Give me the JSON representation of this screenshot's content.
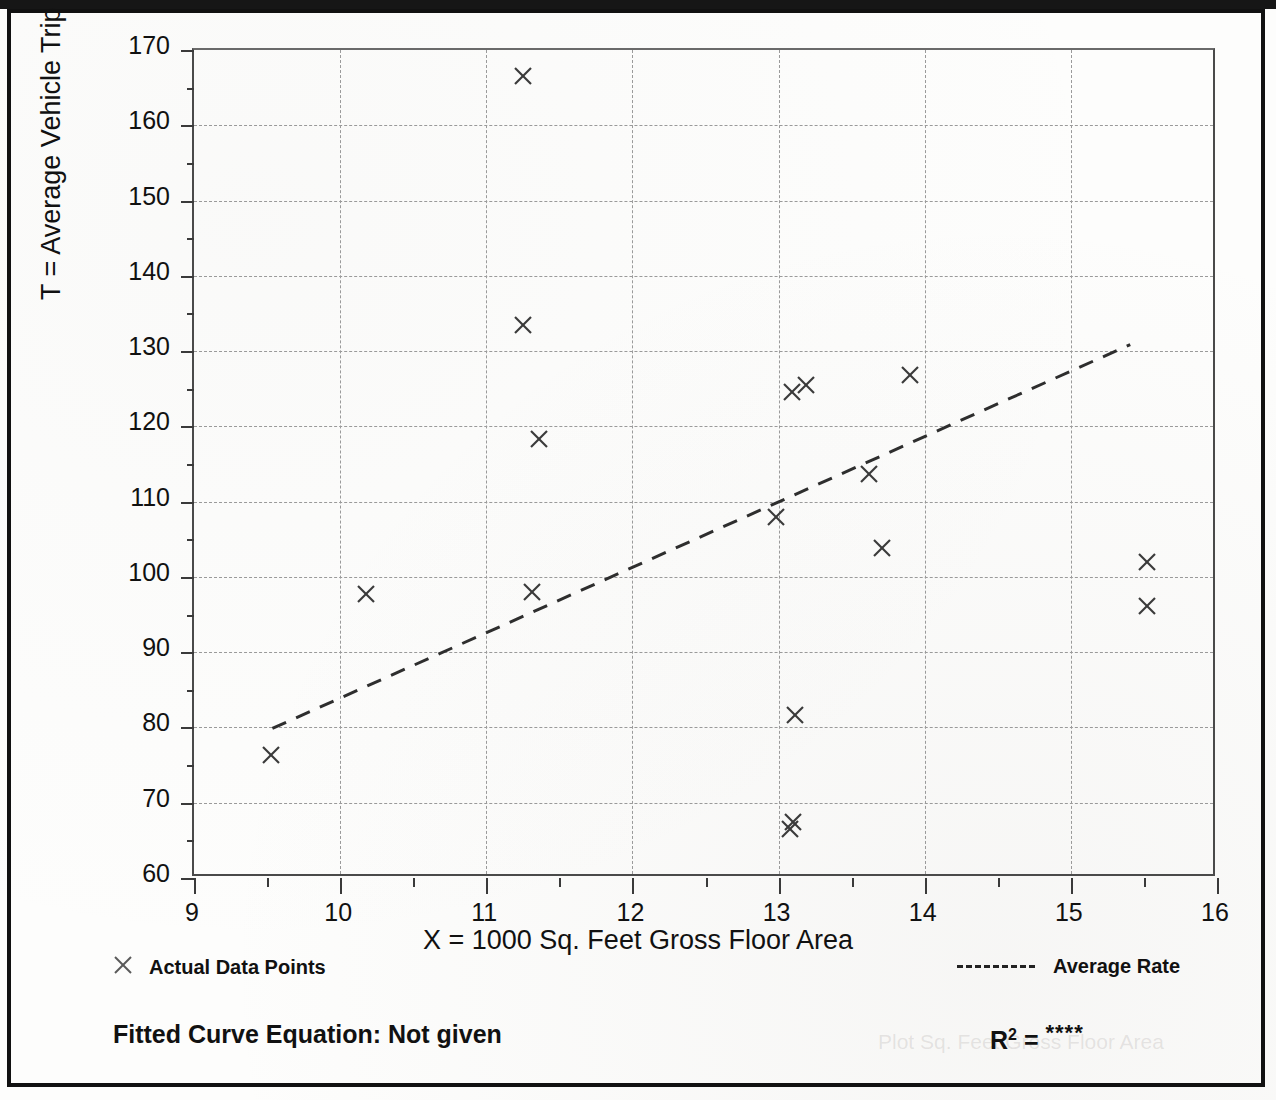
{
  "figure": {
    "y_axis_title": "T = Average Vehicle Trip Ends",
    "x_axis_title": "X = 1000 Sq. Feet Gross Floor Area",
    "legend_points_label": "Actual Data Points",
    "legend_rate_label": "Average Rate",
    "fitted_equation_label": "Fitted Curve Equation:  Not given",
    "r_squared_symbol": "R",
    "r_squared_exponent": "2",
    "r_squared_equals": " = ",
    "r_squared_value": "****",
    "ghost_text_right": "Plot Sq. Feet Gross Floor Area"
  },
  "chart_data": {
    "type": "scatter",
    "title": "",
    "xlabel": "X = 1000 Sq. Feet Gross Floor Area",
    "ylabel": "T = Average Vehicle Trip Ends",
    "xlim": [
      9,
      16
    ],
    "ylim": [
      60,
      170
    ],
    "xticks": [
      9,
      10,
      11,
      12,
      13,
      14,
      15,
      16
    ],
    "xtick_labels": [
      "9",
      "10",
      "11",
      "12",
      "13",
      "14",
      "15",
      "16"
    ],
    "x_minor_step": 0.5,
    "yticks": [
      60,
      70,
      80,
      90,
      100,
      110,
      120,
      130,
      140,
      150,
      160,
      170
    ],
    "ytick_labels": [
      "60",
      "70",
      "80",
      "90",
      "100",
      "110",
      "120",
      "130",
      "140",
      "150",
      "160",
      "170"
    ],
    "y_minor_step": 5,
    "grid": true,
    "grid_style": "dashed",
    "legend_position": "below-axes",
    "series": [
      {
        "name": "Actual Data Points",
        "type": "scatter",
        "marker": "x",
        "color": "#3a3a3a",
        "points": [
          {
            "x": 9.53,
            "y": 76.3
          },
          {
            "x": 10.18,
            "y": 97.7
          },
          {
            "x": 11.25,
            "y": 166.5
          },
          {
            "x": 11.25,
            "y": 133.4
          },
          {
            "x": 11.31,
            "y": 98.0
          },
          {
            "x": 11.36,
            "y": 118.3
          },
          {
            "x": 12.98,
            "y": 107.9
          },
          {
            "x": 13.09,
            "y": 124.6
          },
          {
            "x": 13.11,
            "y": 81.6
          },
          {
            "x": 13.1,
            "y": 67.4
          },
          {
            "x": 13.08,
            "y": 66.5
          },
          {
            "x": 13.19,
            "y": 125.5
          },
          {
            "x": 13.71,
            "y": 103.9
          },
          {
            "x": 13.62,
            "y": 113.7
          },
          {
            "x": 13.9,
            "y": 126.8
          },
          {
            "x": 15.52,
            "y": 102.0
          },
          {
            "x": 15.52,
            "y": 96.1
          }
        ]
      },
      {
        "name": "Average Rate",
        "type": "line",
        "style": "dashed",
        "color": "#2e2e2e",
        "x": [
          9.55,
          15.42
        ],
        "y": [
          79.6,
          130.6
        ]
      }
    ]
  }
}
